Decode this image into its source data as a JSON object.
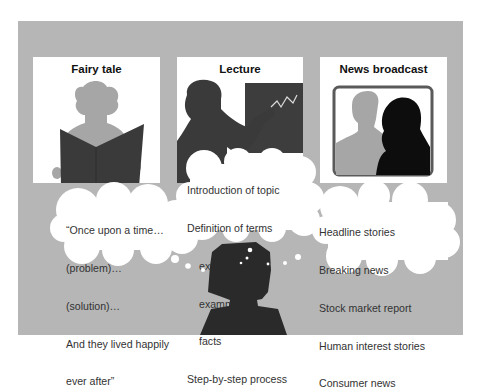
{
  "colors": {
    "background_panel": "#b6b6b6",
    "panel": "#ffffff",
    "silhouette_light": "#a6a6a6",
    "silhouette_dark": "#3a3a3a",
    "silhouette_black": "#0d0d0d",
    "chalkboard": "#3d3d3d",
    "tv_frame": "#5a5a5a"
  },
  "panels": [
    {
      "title": "Fairy tale",
      "icon": "reader-with-book-icon",
      "cloud_lines": [
        {
          "text": "“Once upon a time…",
          "indent": false
        },
        {
          "text": "(problem)…",
          "indent": false
        },
        {
          "text": "(solution)…",
          "indent": false
        },
        {
          "text": "And they lived happily",
          "indent": false
        },
        {
          "text": "ever after”",
          "indent": false
        }
      ]
    },
    {
      "title": "Lecture",
      "icon": "lecturer-at-chalkboard-icon",
      "cloud_lines": [
        {
          "text": "Introduction of topic",
          "indent": false
        },
        {
          "text": "Definition of terms",
          "indent": false
        },
        {
          "text": "explanations",
          "indent": true
        },
        {
          "text": "examples",
          "indent": true
        },
        {
          "text": "facts",
          "indent": true
        },
        {
          "text": "Step-by-step process",
          "indent": false
        }
      ]
    },
    {
      "title": "News broadcast",
      "icon": "tv-anchors-icon",
      "cloud_lines": [
        {
          "text": "Headline stories",
          "indent": false
        },
        {
          "text": "Breaking news",
          "indent": false
        },
        {
          "text": "Stock market report",
          "indent": false
        },
        {
          "text": "Human interest stories",
          "indent": false
        },
        {
          "text": "Consumer news",
          "indent": false
        }
      ]
    }
  ],
  "thinker": {
    "icon": "thinking-person-silhouette-icon"
  }
}
